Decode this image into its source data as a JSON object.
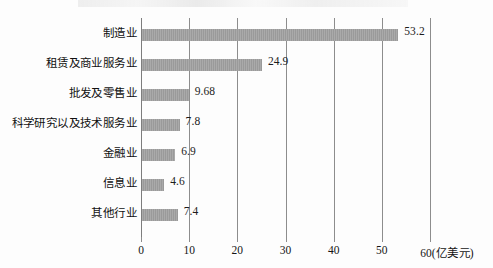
{
  "chart_data": {
    "type": "bar",
    "orientation": "horizontal",
    "title": "",
    "xlabel": "(亿美元)",
    "ylabel": "",
    "xlim": [
      0,
      60
    ],
    "xticks": [
      0,
      10,
      20,
      30,
      40,
      50,
      60
    ],
    "xtick_labels": [
      "0",
      "10",
      "20",
      "30",
      "40",
      "50",
      "60"
    ],
    "axis_unit_label": "(亿美元)",
    "grid": true,
    "grid_axis": "x",
    "legend": false,
    "bar_color": "#9a9a9a",
    "grid_color": "#8d8d8d",
    "text_color": "#111111",
    "categories": [
      "制造业",
      "租赁及商业服务业",
      "批发及零售业",
      "科学研究以及技术服务业",
      "金融业",
      "信息业",
      "其他行业"
    ],
    "values": [
      53.2,
      24.9,
      9.68,
      7.8,
      6.9,
      4.6,
      7.4
    ],
    "value_labels": [
      "53.2",
      "24.9",
      "9.68",
      "7.8",
      "6.9",
      "4.6",
      "7.4"
    ]
  }
}
